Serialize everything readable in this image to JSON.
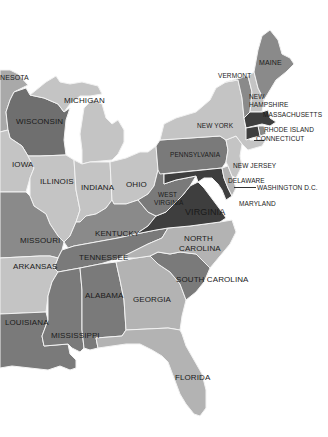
{
  "map": {
    "title": "Eastern United States",
    "colors": {
      "background": "#ffffff",
      "lightest": "#c4c4c4",
      "light": "#a9a9a9",
      "medium": "#8a8a8a",
      "dark": "#6f6f6f",
      "darkest": "#3e3e3e"
    },
    "states": [
      {
        "name": "MINNESOTA",
        "visible_label": "NESOTA",
        "shade": "light"
      },
      {
        "name": "WISCONSIN",
        "visible_label": "WISCONSIN",
        "shade": "dark"
      },
      {
        "name": "MICHIGAN",
        "visible_label": "MICHIGAN",
        "shade": "lightest"
      },
      {
        "name": "IOWA",
        "visible_label": "IOWA",
        "shade": "lightest"
      },
      {
        "name": "ILLINOIS",
        "visible_label": "ILLINOIS",
        "shade": "lightest"
      },
      {
        "name": "INDIANA",
        "visible_label": "INDIANA",
        "shade": "lightest"
      },
      {
        "name": "OHIO",
        "visible_label": "OHIO",
        "shade": "lightest"
      },
      {
        "name": "MISSOURI",
        "visible_label": "MISSOURI",
        "shade": "dark"
      },
      {
        "name": "KENTUCKY",
        "visible_label": "KENTUCKY",
        "shade": "dark"
      },
      {
        "name": "ARKANSAS",
        "visible_label": "ARKANSAS",
        "shade": "lightest"
      },
      {
        "name": "TENNESSEE",
        "visible_label": "TENNESSEE",
        "shade": "dark"
      },
      {
        "name": "LOUISIANA",
        "visible_label": "LOUISIANA",
        "shade": "dark"
      },
      {
        "name": "MISSISSIPPI",
        "visible_label": "MISSISSIPPI",
        "shade": "dark"
      },
      {
        "name": "ALABAMA",
        "visible_label": "ALABAMA",
        "shade": "dark"
      },
      {
        "name": "GEORGIA",
        "visible_label": "GEORGIA",
        "shade": "lightest"
      },
      {
        "name": "FLORIDA",
        "visible_label": "FLORIDA",
        "shade": "lightest"
      },
      {
        "name": "SOUTH CAROLINA",
        "visible_label": "SOUTH CAROLINA",
        "shade": "dark"
      },
      {
        "name": "NORTH CAROLINA",
        "visible_label": "NORTH CAROLINA",
        "shade": "lightest"
      },
      {
        "name": "VIRGINIA",
        "visible_label": "VIRGINIA",
        "shade": "darkest"
      },
      {
        "name": "WEST VIRGINIA",
        "visible_label": "WEST VIRGINIA",
        "shade": "dark"
      },
      {
        "name": "PENNSYLVANIA",
        "visible_label": "PENNSYLVANIA",
        "shade": "dark"
      },
      {
        "name": "NEW YORK",
        "visible_label": "NEW YORK",
        "shade": "lightest"
      },
      {
        "name": "NEW JERSEY",
        "visible_label": "NEW JERSEY",
        "shade": "lightest"
      },
      {
        "name": "DELAWARE",
        "visible_label": "DELAWARE",
        "shade": "lightest"
      },
      {
        "name": "MARYLAND",
        "visible_label": "MARYLAND",
        "shade": "darkest"
      },
      {
        "name": "WASHINGTON D.C.",
        "visible_label": "WASHINGTON D.C.",
        "shade": "darkest"
      },
      {
        "name": "VERMONT",
        "visible_label": "VERMONT",
        "shade": "dark"
      },
      {
        "name": "NEW HAMPSHIRE",
        "visible_label": "NEW HAMPSHIRE",
        "shade": "lightest"
      },
      {
        "name": "MAINE",
        "visible_label": "MAINE",
        "shade": "dark"
      },
      {
        "name": "MASSACHUSETTS",
        "visible_label": "MASSACHUSETTS",
        "shade": "darkest"
      },
      {
        "name": "RHODE ISLAND",
        "visible_label": "RHODE ISLAND",
        "shade": "dark"
      },
      {
        "name": "CONNECTICUT",
        "visible_label": "CONNECTICUT",
        "shade": "darkest"
      }
    ],
    "labels": {
      "minnesota": "NESOTA",
      "wisconsin": "WISCONSIN",
      "michigan": "MICHIGAN",
      "iowa": "IOWA",
      "illinois": "ILLINOIS",
      "indiana": "INDIANA",
      "ohio": "OHIO",
      "missouri": "MISSOURI",
      "kentucky": "KENTUCKY",
      "arkansas": "ARKANSAS",
      "tennessee": "TENNESSEE",
      "louisiana": "LOUISIANA",
      "mississippi": "MISSISSIPPI",
      "alabama": "ALABAMA",
      "georgia": "GEORGIA",
      "florida": "FLORIDA",
      "south_carolina": "SOUTH CAROLINA",
      "north_carolina_1": "NORTH",
      "north_carolina_2": "CAROLINA",
      "virginia": "VIRGINIA",
      "west_virginia_1": "WEST",
      "west_virginia_2": "VIRGINIA",
      "pennsylvania": "PENNSYLVANIA",
      "new_york": "NEW YORK",
      "new_jersey": "NEW JERSEY",
      "delaware": "DELAWARE",
      "maryland": "MARYLAND",
      "washington_dc": "WASHINGTON D.C.",
      "vermont": "VERMONT",
      "new_hampshire_1": "NEW",
      "new_hampshire_2": "HAMPSHIRE",
      "maine": "MAINE",
      "massachusetts": "MASSACHUSETTS",
      "rhode_island": "RHODE ISLAND",
      "connecticut": "CONNECTICUT"
    }
  }
}
